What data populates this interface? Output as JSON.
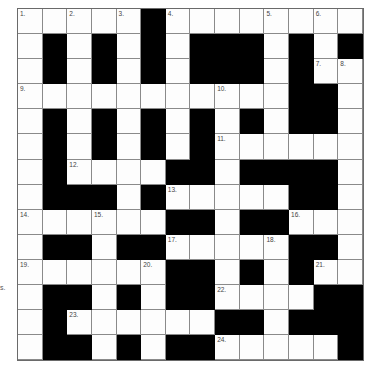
{
  "puzzle": {
    "rows": 14,
    "cols": 14,
    "stray_text": "s.",
    "colors": {
      "black": "#000000",
      "white": "#fdfdfd",
      "line": "#8a8a8a"
    },
    "grid": [
      [
        "1",
        "W",
        "2",
        "W",
        "3",
        "B",
        "4",
        "W",
        "W",
        "W",
        "5",
        "W",
        "6",
        "W"
      ],
      [
        "W",
        "B",
        "W",
        "B",
        "W",
        "B",
        "W",
        "B",
        "B",
        "B",
        "W",
        "B",
        "W",
        "B"
      ],
      [
        "W",
        "B",
        "W",
        "B",
        "W",
        "B",
        "W",
        "B",
        "B",
        "B",
        "W",
        "B",
        "7",
        "8"
      ],
      [
        "9",
        "W",
        "W",
        "W",
        "W",
        "W",
        "W",
        "W",
        "10",
        "W",
        "W",
        "B",
        "B",
        "W"
      ],
      [
        "W",
        "B",
        "W",
        "B",
        "W",
        "B",
        "W",
        "B",
        "W",
        "B",
        "W",
        "B",
        "B",
        "W"
      ],
      [
        "W",
        "B",
        "W",
        "B",
        "W",
        "B",
        "W",
        "B",
        "11",
        "W",
        "W",
        "W",
        "W",
        "W"
      ],
      [
        "W",
        "B",
        "12",
        "W",
        "W",
        "W",
        "B",
        "B",
        "W",
        "B",
        "B",
        "B",
        "B",
        "W"
      ],
      [
        "W",
        "B",
        "B",
        "B",
        "W",
        "B",
        "13",
        "W",
        "W",
        "W",
        "W",
        "B",
        "B",
        "W"
      ],
      [
        "14",
        "W",
        "W",
        "15",
        "W",
        "W",
        "B",
        "B",
        "W",
        "B",
        "B",
        "16",
        "W",
        "W"
      ],
      [
        "W",
        "B",
        "B",
        "W",
        "B",
        "B",
        "17",
        "W",
        "W",
        "W",
        "18",
        "B",
        "B",
        "W"
      ],
      [
        "19",
        "W",
        "W",
        "W",
        "W",
        "20",
        "B",
        "B",
        "W",
        "B",
        "W",
        "B",
        "21",
        "W"
      ],
      [
        "W",
        "B",
        "B",
        "W",
        "B",
        "W",
        "B",
        "B",
        "22",
        "W",
        "W",
        "W",
        "B",
        "B"
      ],
      [
        "W",
        "B",
        "23",
        "W",
        "W",
        "W",
        "W",
        "W",
        "B",
        "B",
        "W",
        "B",
        "B",
        "B"
      ],
      [
        "W",
        "B",
        "B",
        "W",
        "B",
        "W",
        "B",
        "B",
        "24",
        "W",
        "W",
        "W",
        "W",
        "B"
      ]
    ]
  }
}
